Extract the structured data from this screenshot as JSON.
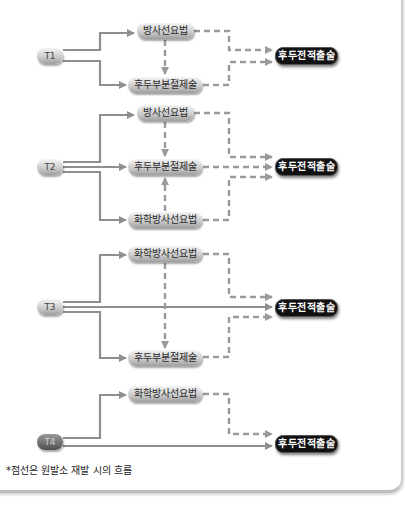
{
  "header": {
    "partial_text": ""
  },
  "colors": {
    "solid_line": "#8f8f8f",
    "dashed_line": "#9a9a9a",
    "end_node": "#111111"
  },
  "diagrams": [
    {
      "stage": "T1",
      "nodes": {
        "top": "방사선요법",
        "bottom": "후두부분절제술",
        "end": "후두전적출술"
      }
    },
    {
      "stage": "T2",
      "nodes": {
        "top": "방사선요법",
        "middle": "후두부분절제술",
        "bottom": "화학방사선요법",
        "end": "후두전적출술"
      }
    },
    {
      "stage": "T3",
      "nodes": {
        "top": "화학방사선요법",
        "bottom": "후두부분절제술",
        "end": "후두전적출술"
      }
    },
    {
      "stage": "T4",
      "nodes": {
        "top": "화학방사선요법",
        "end": "후두전적출술"
      }
    }
  ],
  "footnote": "*점선은 원발소 재발 시의 흐름"
}
